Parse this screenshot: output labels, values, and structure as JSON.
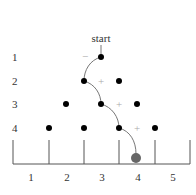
{
  "diagram": {
    "type": "galton-board-path",
    "start_label": "start",
    "row_labels": [
      "1",
      "2",
      "3",
      "4"
    ],
    "bin_labels": [
      "1",
      "2",
      "3",
      "4",
      "5"
    ],
    "rows": [
      {
        "label": "1",
        "pegs": [
          101
        ]
      },
      {
        "label": "2",
        "pegs": [
          84,
          119
        ]
      },
      {
        "label": "3",
        "pegs": [
          66,
          101,
          137
        ]
      },
      {
        "label": "4",
        "pegs": [
          49,
          84,
          119,
          155
        ]
      }
    ],
    "path_signs": [
      "−",
      "+",
      "+",
      "+"
    ],
    "result_bin": "4",
    "colors": {
      "peg": "#000000",
      "path": "#777777",
      "ball": "#666666",
      "sign": "#aaaaaa",
      "text": "#333333"
    }
  }
}
